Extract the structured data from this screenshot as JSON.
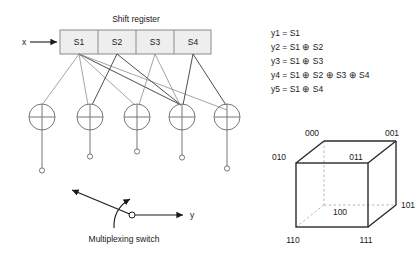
{
  "diagram": {
    "shift_register": {
      "title": "Shift register",
      "input_label": "x",
      "cells": [
        {
          "label": "S1"
        },
        {
          "label": "S2"
        },
        {
          "label": "S3"
        },
        {
          "label": "S4"
        }
      ]
    },
    "xor_gates": [
      {
        "name": "xor-gate-1",
        "symbol": "⊕",
        "output": "y1"
      },
      {
        "name": "xor-gate-2",
        "symbol": "⊕",
        "output": "y2"
      },
      {
        "name": "xor-gate-3",
        "symbol": "⊕",
        "output": "y3"
      },
      {
        "name": "xor-gate-4",
        "symbol": "⊕",
        "output": "y4"
      },
      {
        "name": "xor-gate-5",
        "symbol": "⊕",
        "output": "y5"
      }
    ],
    "multiplexing_switch": {
      "caption": "Multiplexing switch",
      "output_label": "y"
    },
    "equations": [
      "y1 = S1",
      "y2 = S1 ⊕ S2",
      "y3 = S1 ⊕ S3",
      "y4 = S1 ⊕ S2 ⊕ S3 ⊕ S4",
      "y5 = S1 ⊕ S4"
    ],
    "cube": {
      "vertices": [
        {
          "label": "000"
        },
        {
          "label": "001"
        },
        {
          "label": "010"
        },
        {
          "label": "011"
        },
        {
          "label": "100"
        },
        {
          "label": "101"
        },
        {
          "label": "110"
        },
        {
          "label": "111"
        }
      ]
    },
    "colors": {
      "register_fill": "#eeeeee",
      "register_stroke": "#8a8a8a",
      "gate_stroke": "#777777",
      "tap_light": "#8d8d8d",
      "tap_dark": "#3a3a3a",
      "cube_edge": "#2b2b2b",
      "cube_hidden": "#b4b4b4",
      "text": "#1a1a1a"
    }
  }
}
